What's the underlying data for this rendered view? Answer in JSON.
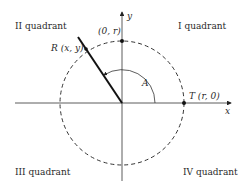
{
  "diagram": {
    "type": "unit-circle-angle",
    "quadrants": {
      "q1": "I quadrant",
      "q2": "II quadrant",
      "q3": "III quadrant",
      "q4": "IV quadrant"
    },
    "axes": {
      "x_label": "x",
      "y_label": "y"
    },
    "points": {
      "top": "(0, r)",
      "right": "T (r, 0)",
      "terminal": "R (x, y)"
    },
    "angle_label": "A",
    "colors": {
      "stroke": "#222222",
      "background": "#ffffff"
    }
  }
}
